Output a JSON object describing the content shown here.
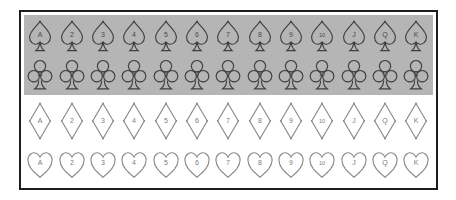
{
  "ranks": [
    "A",
    "2",
    "3",
    "4",
    "5",
    "6",
    "7",
    "8",
    "9",
    "10",
    "J",
    "Q",
    "K"
  ],
  "rows": [
    {
      "suit": "spade",
      "shaded": true
    },
    {
      "suit": "club",
      "shaded": true
    },
    {
      "suit": "diamond",
      "shaded": false
    },
    {
      "suit": "heart",
      "shaded": false
    }
  ],
  "colors": {
    "background": "#ffffff",
    "frame_border": "#1d1d1d",
    "shaded_panel": "#b5b5b5",
    "dark_suit_outline": "#3f3f3f",
    "light_suit_outline": "#8c8c8c",
    "dark_rank_label": "#4a4a4a",
    "light_rank_label": "#7d7d7d"
  }
}
